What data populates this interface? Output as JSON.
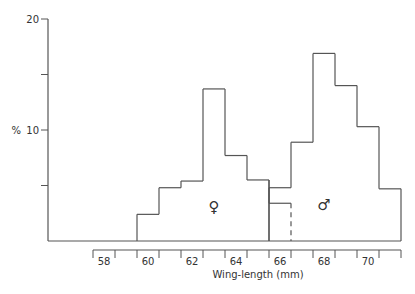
{
  "chart_data": {
    "type": "bar",
    "title": "",
    "xlabel": "Wing-length (mm)",
    "ylabel": "%",
    "ylim": [
      0,
      20
    ],
    "xlim": [
      57.5,
      71.5
    ],
    "bin_width": 1,
    "y_ticks": [
      0,
      5,
      10,
      15,
      20
    ],
    "y_tick_labels": [
      {
        "value": 20,
        "label": "20"
      },
      {
        "value": 10,
        "label": "10"
      }
    ],
    "x_tick_edges": [
      57.5,
      58.5,
      59.5,
      60.5,
      61.5,
      62.5,
      63.5,
      64.5,
      65.5,
      66.5,
      67.5,
      68.5,
      69.5,
      70.5,
      71.5
    ],
    "x_tick_labels": [
      {
        "value": 58,
        "label": "58"
      },
      {
        "value": 60,
        "label": "60"
      },
      {
        "value": 62,
        "label": "62"
      },
      {
        "value": 64,
        "label": "64"
      },
      {
        "value": 66,
        "label": "66"
      },
      {
        "value": 68,
        "label": "68"
      },
      {
        "value": 70,
        "label": "70"
      }
    ],
    "grid": false,
    "legend": "none",
    "series": [
      {
        "name": "female",
        "symbol": "♀",
        "symbol_at": {
          "x": 63,
          "y": 2.6
        },
        "bin_centers": [
          60,
          61,
          62,
          63,
          64,
          65,
          66
        ],
        "values": [
          2.4,
          4.8,
          5.4,
          13.7,
          7.7,
          5.5,
          3.4
        ],
        "note": "bin at 66 overlaps male distribution (drawn with dashed right edge)"
      },
      {
        "name": "male",
        "symbol": "♂",
        "symbol_at": {
          "x": 68,
          "y": 2.8
        },
        "bin_centers": [
          66,
          67,
          68,
          69,
          70,
          71
        ],
        "values": [
          4.8,
          8.9,
          16.9,
          14.0,
          10.3,
          4.7
        ]
      }
    ]
  }
}
